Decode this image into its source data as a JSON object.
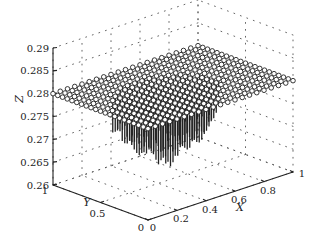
{
  "chart_data": {
    "type": "scatter3d",
    "title": "",
    "xlabel": "X",
    "ylabel": "Y",
    "zlabel": "Z",
    "xlim": [
      0,
      1
    ],
    "ylim": [
      0,
      1
    ],
    "zlim": [
      0.26,
      0.29
    ],
    "x_ticks": [
      "0",
      "0.2",
      "0.4",
      "0.6",
      "0.8",
      "1"
    ],
    "y_ticks": [
      "0",
      "0.5",
      "1"
    ],
    "z_ticks": [
      "0.26",
      "0.265",
      "0.27",
      "0.275",
      "0.28",
      "0.285",
      "0.29"
    ],
    "grid": "dotted",
    "legend": null,
    "series": [
      {
        "name": "surface points",
        "marker": "open-circle",
        "grid_size": 21,
        "z_value": 0.28,
        "description": "Regular 21x21 grid of points over X,Y in [0,1] at Z ≈ 0.28"
      },
      {
        "name": "stems",
        "marker": "vertical-line",
        "region": "central X,Y area",
        "z_min": 0.262,
        "z_max": 0.28,
        "description": "Vertical stems descending from the central grid points toward Z ≈ 0.262"
      }
    ]
  }
}
